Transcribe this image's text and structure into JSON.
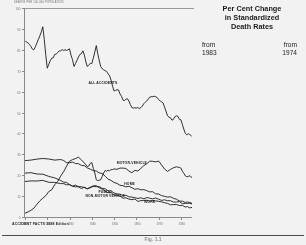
{
  "figure": {
    "caption": "Fig. 1.1",
    "source_note": "ACCIDENT FACTS 1988 Edition",
    "plot_corner_note": "DEATHS PER 100,000 POPULATION"
  },
  "stats": {
    "title_line1": "Per Cent Change",
    "title_line2": "in Standardized",
    "title_line3": "Death Rates",
    "from_label_left": "from",
    "from_label_right": "from",
    "year_left": "1983",
    "year_right": "1974",
    "rows": [
      {
        "category": "All Accidents",
        "from_1983": "-1%",
        "from_1974": "-23%"
      },
      {
        "category": "Motor-Vehicle",
        "from_1983": "+3%",
        "from_1974": "-12%"
      },
      {
        "category": "Work",
        "from_1983": "-2%",
        "from_1974": "-26%"
      },
      {
        "category": "Home",
        "from_1983": "-1%",
        "from_1974": "-35%"
      },
      {
        "category": "Public",
        "from_1983": "-7%",
        "from_1974": "-31%"
      }
    ]
  },
  "chart_data": {
    "type": "line",
    "xlabel": "Year",
    "ylabel": "Deaths per 100,000 Population",
    "xlim": [
      1910,
      1985
    ],
    "ylim": [
      0,
      100
    ],
    "grid": false,
    "legend": "inline-labels",
    "xticks": [
      "1910",
      "1920",
      "1930",
      "1940",
      "1950",
      "1960",
      "1970",
      "1980"
    ],
    "yticks": [
      "0",
      "10",
      "20",
      "30",
      "40",
      "50",
      "60",
      "70",
      "80",
      "90",
      "100"
    ],
    "series": [
      {
        "name": "ALL ACCIDENTS",
        "label_x": 1945,
        "label_y": 64,
        "x": [
          1910,
          1912,
          1914,
          1916,
          1918,
          1920,
          1922,
          1924,
          1926,
          1928,
          1930,
          1932,
          1934,
          1936,
          1938,
          1940,
          1942,
          1944,
          1946,
          1948,
          1950,
          1952,
          1954,
          1956,
          1958,
          1960,
          1962,
          1964,
          1966,
          1968,
          1970,
          1972,
          1974,
          1976,
          1978,
          1980,
          1982,
          1984,
          1985
        ],
        "y": [
          84.4,
          82.5,
          80.0,
          85.0,
          91.0,
          71.2,
          76.0,
          78.0,
          79.5,
          80.0,
          80.5,
          72.0,
          76.5,
          79.5,
          72.0,
          73.4,
          82.0,
          72.0,
          70.0,
          67.5,
          60.3,
          60.8,
          55.9,
          56.6,
          52.3,
          52.1,
          52.3,
          54.9,
          57.3,
          57.8,
          56.2,
          54.6,
          48.4,
          46.3,
          48.4,
          46.5,
          40.0,
          39.4,
          38.5
        ]
      },
      {
        "name": "MOTOR-VEHICLE",
        "label_x": 1958,
        "label_y": 26,
        "x": [
          1910,
          1914,
          1918,
          1922,
          1926,
          1930,
          1934,
          1938,
          1940,
          1942,
          1944,
          1946,
          1948,
          1950,
          1954,
          1958,
          1962,
          1966,
          1970,
          1974,
          1978,
          1980,
          1982,
          1984,
          1985
        ],
        "y": [
          1.8,
          4.2,
          9.0,
          13.0,
          19.5,
          26.7,
          28.6,
          24.1,
          26.1,
          17.8,
          17.8,
          22.3,
          22.1,
          23.0,
          23.4,
          21.2,
          23.2,
          26.7,
          26.8,
          21.8,
          24.0,
          23.4,
          19.7,
          19.7,
          19.2
        ]
      },
      {
        "name": "PUBLIC NON-MOTOR VEHICLE",
        "label_x": 1946,
        "label_y": 11,
        "x": [
          1910,
          1918,
          1926,
          1930,
          1934,
          1938,
          1942,
          1946,
          1950,
          1954,
          1958,
          1962,
          1966,
          1970,
          1974,
          1978,
          1982,
          1985
        ],
        "y": [
          17.0,
          17.5,
          16.0,
          15.5,
          14.5,
          13.5,
          14.5,
          13.5,
          11.5,
          10.3,
          9.5,
          9.2,
          9.0,
          8.5,
          7.8,
          7.2,
          6.5,
          6.2
        ]
      },
      {
        "name": "HOME",
        "label_x": 1957,
        "label_y": 16,
        "x": [
          1910,
          1918,
          1926,
          1930,
          1934,
          1938,
          1942,
          1946,
          1950,
          1954,
          1958,
          1962,
          1966,
          1970,
          1974,
          1978,
          1982,
          1985
        ],
        "y": [
          27.0,
          28.0,
          27.5,
          26.0,
          25.5,
          23.5,
          22.0,
          19.5,
          16.5,
          15.0,
          14.0,
          13.0,
          12.0,
          11.0,
          9.5,
          8.5,
          7.0,
          6.5
        ]
      },
      {
        "name": "WORK",
        "label_x": 1966,
        "label_y": 7,
        "x": [
          1910,
          1918,
          1926,
          1930,
          1934,
          1938,
          1942,
          1946,
          1950,
          1954,
          1958,
          1962,
          1966,
          1970,
          1974,
          1978,
          1982,
          1985
        ],
        "y": [
          21.0,
          20.5,
          17.5,
          15.5,
          14.5,
          13.5,
          15.0,
          12.5,
          10.5,
          9.0,
          8.3,
          7.8,
          7.6,
          7.5,
          6.5,
          6.0,
          4.8,
          4.6
        ]
      }
    ]
  }
}
